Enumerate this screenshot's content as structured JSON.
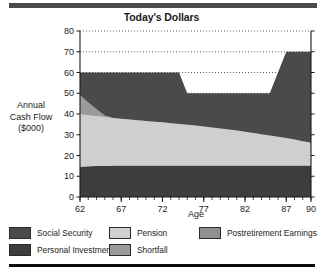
{
  "figure": {
    "title": "Today's Dollars",
    "ylabel_lines": [
      "Annual",
      "Cash Flow",
      "($000)"
    ],
    "xlabel": "Age"
  },
  "legend": {
    "row1": [
      {
        "label": "Social Security",
        "color": "#4a4a4a",
        "name": "legend-social-security"
      },
      {
        "label": "Pension",
        "color": "#cfcfcf",
        "name": "legend-pension"
      },
      {
        "label": "Postretirement Earnings",
        "color": "#8f8f8f",
        "name": "legend-postretirement-earnings"
      }
    ],
    "row2": [
      {
        "label": "Personal Investments",
        "color": "#3d3d3d",
        "name": "legend-personal-investments"
      },
      {
        "label": "Shortfall",
        "color": "#9a9a9a",
        "name": "legend-shortfall"
      }
    ]
  },
  "chart_data": {
    "type": "area",
    "stacked": true,
    "title": "Today's Dollars",
    "xlabel": "Age",
    "ylabel": "Annual Cash Flow ($000)",
    "xlim": [
      62,
      90
    ],
    "ylim": [
      0,
      80
    ],
    "xticks": [
      62,
      67,
      72,
      77,
      82,
      87,
      90
    ],
    "xtick_labels": [
      "62",
      "67",
      "72",
      "77",
      "82",
      "87",
      "90"
    ],
    "yticks": [
      0,
      10,
      20,
      30,
      40,
      50,
      60,
      70,
      80
    ],
    "ytick_labels": [
      "0",
      "10",
      "20",
      "30",
      "40",
      "50",
      "60",
      "70",
      "80"
    ],
    "minor_xticks_step": 1,
    "grid": "horizontal-dotted",
    "legend_position": "below",
    "x": [
      62,
      63,
      64,
      65,
      66,
      67,
      68,
      69,
      70,
      71,
      72,
      73,
      74,
      75,
      76,
      77,
      78,
      79,
      80,
      81,
      82,
      83,
      84,
      85,
      86,
      87,
      88,
      89,
      90
    ],
    "series": [
      {
        "name": "Personal Investments",
        "color": "#3d3d3d",
        "order": 1,
        "values": [
          14.6,
          14.8,
          15.0,
          15.1,
          15.2,
          15.2,
          15.2,
          15.2,
          15.2,
          15.2,
          15.2,
          15.2,
          15.2,
          15.2,
          15.2,
          15.2,
          15.2,
          15.2,
          15.2,
          15.2,
          15.2,
          15.2,
          15.2,
          15.2,
          15.2,
          15.2,
          15.2,
          15.2,
          15.2
        ]
      },
      {
        "name": "Pension",
        "color": "#cfcfcf",
        "order": 2,
        "values": [
          25.4,
          24.6,
          23.9,
          23.4,
          22.9,
          22.5,
          22.1,
          21.8,
          21.4,
          21.1,
          20.8,
          20.4,
          20.0,
          19.6,
          19.2,
          18.8,
          18.3,
          17.8,
          17.3,
          16.8,
          16.2,
          15.6,
          15.0,
          14.4,
          13.8,
          13.2,
          12.5,
          11.7,
          10.9
        ]
      },
      {
        "name": "Shortfall",
        "color": "#9a9a9a",
        "order": 3,
        "values": [
          9.0,
          6.2,
          3.4,
          0.8,
          0,
          0,
          0,
          0,
          0,
          0,
          0,
          0,
          0,
          0,
          0,
          0,
          0,
          0,
          0,
          0,
          0,
          0,
          0,
          0,
          0,
          0,
          0,
          0,
          0
        ]
      },
      {
        "name": "Social Security",
        "color": "#4a4a4a",
        "order": 4,
        "values": [
          11.0,
          14.4,
          17.7,
          20.7,
          21.9,
          22.3,
          22.7,
          23.0,
          23.4,
          23.7,
          24.0,
          24.4,
          24.8,
          15.2,
          15.6,
          16.0,
          16.5,
          17.0,
          17.5,
          18.0,
          18.6,
          19.2,
          19.8,
          20.4,
          31.0,
          41.6,
          42.3,
          43.1,
          43.9
        ]
      }
    ],
    "stack_tops": {
      "description": "Total of stacked bands at each age",
      "values": [
        60.0,
        60.0,
        60.0,
        60.0,
        60.0,
        60.0,
        60.0,
        60.0,
        60.0,
        60.0,
        60.0,
        60.0,
        60.0,
        50.0,
        50.0,
        50.0,
        50.0,
        50.0,
        50.0,
        50.0,
        50.0,
        50.0,
        50.0,
        50.0,
        60.0,
        70.0,
        70.0,
        70.0,
        70.0
      ]
    },
    "annotations": [
      "Top of stack steps down from 60 to 50 near age 74-75",
      "Top of stack steps up from 50 to 70 between age 85 and 87",
      "Shortfall wedge present only from age 62 to about age 65"
    ]
  }
}
